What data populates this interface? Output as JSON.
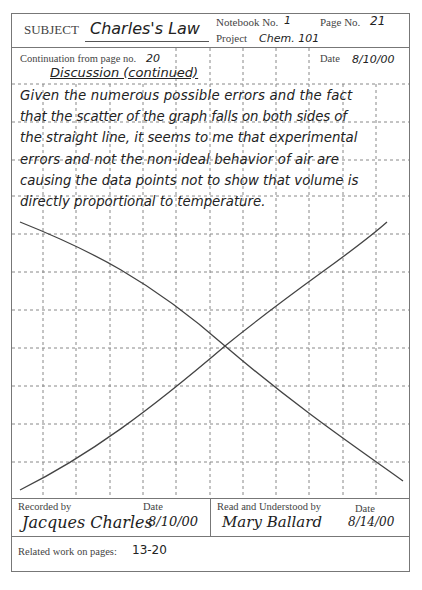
{
  "header": {
    "subject_label": "SUBJECT",
    "subject_value": "Charles's Law",
    "notebook_label": "Notebook No.",
    "notebook_value": "1",
    "page_label": "Page No.",
    "page_value": "21",
    "project_label": "Project",
    "project_value": "Chem. 101"
  },
  "continuation": {
    "label": "Continuation from page no.",
    "value": "20",
    "date_label": "Date",
    "date_value": "8/10/00"
  },
  "body": {
    "heading": "Discussion (continued)",
    "lines": [
      "Given the numerous possible errors and the fact",
      "that the scatter of the graph falls on both sides of",
      "the straight line, it seems to me that experimental",
      "errors and not the non-ideal behavior of air are",
      "causing the data points not to show that volume is",
      "directly proportional to temperature."
    ]
  },
  "diagram": {
    "line_color": "#444444"
  },
  "footer": {
    "recorded_by_label": "Recorded by",
    "recorded_by_value": "Jacques Charles",
    "recorded_date_label": "Date",
    "recorded_date_value": "8/10/00",
    "read_by_label": "Read and Understood by",
    "read_by_value": "Mary Ballard",
    "read_date_label": "Date",
    "read_date_value": "8/14/00",
    "related_label": "Related work on pages:",
    "related_value": "13-20"
  }
}
